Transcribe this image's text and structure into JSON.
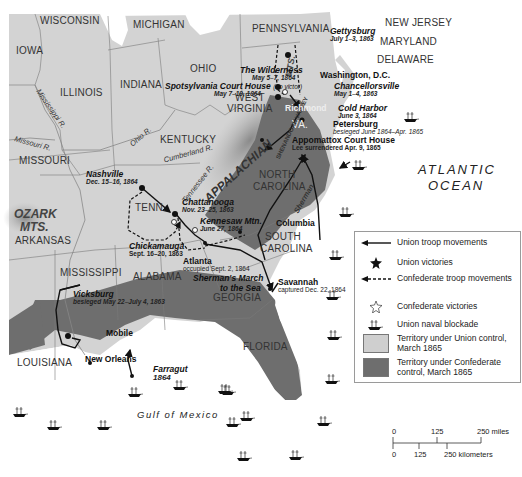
{
  "map": {
    "states": {
      "wisconsin": "WISCONSIN",
      "michigan": "MICHIGAN",
      "pennsylvania": "PENNSYLVANIA",
      "new_jersey": "NEW JERSEY",
      "maryland": "MARYLAND",
      "delaware": "DELAWARE",
      "iowa": "IOWA",
      "ohio": "OHIO",
      "illinois": "ILLINOIS",
      "indiana": "INDIANA",
      "west_virginia_1": "WEST",
      "west_virginia_2": "VIRGINIA",
      "virginia": "VA.",
      "kentucky": "KENTUCKY",
      "missouri": "MISSOURI",
      "tennessee": "TENN.",
      "north_carolina_1": "NORTH",
      "north_carolina_2": "CAROLINA",
      "south_carolina_1": "SOUTH",
      "south_carolina_2": "CAROLINA",
      "arkansas": "ARKANSAS",
      "mississippi": "MISSISSIPPI",
      "alabama": "ALABAMA",
      "georgia": "GEORGIA",
      "louisiana": "LOUISIANA",
      "florida": "FLORIDA"
    },
    "physical": {
      "appalachian": "APPALACHIAN",
      "mts": "MTS.",
      "ozark_1": "OZARK",
      "ozark_2": "MTS.",
      "shenandoah_valley": "SHENANDOAH VALLEY",
      "mississippi_r": "Mississippi R.",
      "missouri_r": "Missouri R.",
      "ohio_r": "Ohio R.",
      "cumberland_r": "Cumberland R.",
      "tennessee_r": "Tennessee R.",
      "atlantic_1": "ATLANTIC",
      "atlantic_2": "OCEAN",
      "gulf": "Gulf of Mexico"
    },
    "places": {
      "gettysburg": {
        "name": "Gettysburg",
        "date": "July 1–3, 1863"
      },
      "wilderness": {
        "name": "The Wilderness",
        "date": "May 5–7, 1864"
      },
      "spotsylvania": {
        "name": "Spotsylvania Court House",
        "note": "(no victor)",
        "date": "May 7–19, 1864"
      },
      "washington": {
        "name": "Washington, D.C."
      },
      "chancellorsville": {
        "name": "Chancellorsville",
        "date": "May 1–4, 1863"
      },
      "richmond": {
        "name": "Richmond"
      },
      "cold_harbor": {
        "name": "Cold Harbor",
        "date": "June 3, 1864"
      },
      "petersburg": {
        "name": "Petersburg",
        "date": "besieged June 1864–Apr. 1865"
      },
      "appomattox": {
        "name": "Appomattox Court House",
        "date": "Lee surrendered Apr. 9, 1865"
      },
      "nashville": {
        "name": "Nashville",
        "date": "Dec. 15–16, 1864"
      },
      "chattanooga": {
        "name": "Chattanooga",
        "date": "Nov. 23–25, 1863"
      },
      "kennesaw": {
        "name": "Kennesaw Mtn.",
        "date": "June 27, 1864"
      },
      "chickamauga": {
        "name": "Chickamauga",
        "date": "Sept. 16–20, 1863"
      },
      "atlanta": {
        "name": "Atlanta",
        "date": "occupied Sept. 2, 1864"
      },
      "columbia": {
        "name": "Columbia"
      },
      "sherman_label": "Sherman",
      "shermans_march_1": "Sherman's March",
      "shermans_march_2": "to the Sea",
      "savannah": {
        "name": "Savannah",
        "date": "captured Dec. 22, 1864"
      },
      "vicksburg": {
        "name": "Vicksburg",
        "date": "besieged May 22–July 4, 1863"
      },
      "mobile": {
        "name": "Mobile"
      },
      "new_orleans": {
        "name": "New Orleans"
      },
      "farragut": {
        "name": "Farragut",
        "date": "1864"
      }
    }
  },
  "legend": {
    "items": [
      {
        "icon": "union-arrow",
        "label": "Union troop movements"
      },
      {
        "icon": "union-victory-star",
        "label": "Union victories"
      },
      {
        "icon": "confederate-dashed-arrow",
        "label": "Confederate troop movements"
      },
      {
        "icon": "confederate-victory-star",
        "label": "Confederate victories"
      },
      {
        "icon": "ship",
        "label": "Union naval blockade"
      },
      {
        "icon": "swatch-light",
        "label": "Territory under Union control, March 1865",
        "color": "#cfcfcf"
      },
      {
        "icon": "swatch-dark",
        "label": "Territory under Confederate control, March 1865",
        "color": "#6e6e6e"
      }
    ]
  },
  "scale": {
    "miles_ticks": [
      "0",
      "125",
      "250 miles"
    ],
    "km_ticks": [
      "0",
      "125",
      "250 kilometers"
    ]
  },
  "colors": {
    "union_land": "#d4d4d4",
    "confederate": "#6e6e6e",
    "water": "#ffffff",
    "border": "#7a7a7a"
  }
}
